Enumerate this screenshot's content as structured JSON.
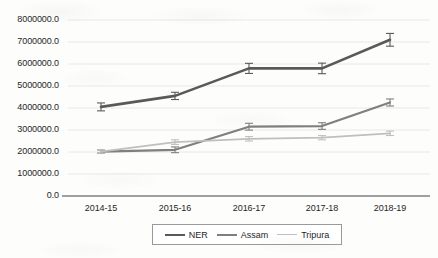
{
  "chart_data": {
    "type": "line",
    "title": "",
    "xlabel": "",
    "ylabel": "",
    "categories": [
      "2014-15",
      "2015-16",
      "2016-17",
      "2017-18",
      "2018-19"
    ],
    "ylim": [
      0,
      8000000
    ],
    "ytick_values": [
      0,
      1000000,
      2000000,
      3000000,
      4000000,
      5000000,
      6000000,
      7000000,
      8000000
    ],
    "ytick_labels": [
      "0.0",
      "1000000.0",
      "2000000.0",
      "3000000.0",
      "4000000.0",
      "5000000.0",
      "6000000.0",
      "7000000.0",
      "8000000.0"
    ],
    "grid": true,
    "grid_axis": "y",
    "legend_position": "bottom",
    "error_bars": true,
    "series": [
      {
        "name": "NER",
        "color": "#595959",
        "values": [
          4050000,
          4550000,
          5800000,
          5800000,
          7100000
        ],
        "errors": [
          180000,
          165000,
          230000,
          240000,
          290000
        ]
      },
      {
        "name": "Assam",
        "color": "#7f7f7f",
        "values": [
          2020000,
          2100000,
          3150000,
          3180000,
          4250000
        ],
        "errors": [
          70000,
          130000,
          155000,
          150000,
          160000
        ]
      },
      {
        "name": "Tripura",
        "color": "#bfbfbf",
        "values": [
          2020000,
          2450000,
          2600000,
          2650000,
          2850000
        ],
        "errors": [
          70000,
          105000,
          100000,
          95000,
          100000
        ]
      }
    ]
  },
  "legend": {
    "items": [
      {
        "label": "NER",
        "color": "#595959",
        "width": 2.6
      },
      {
        "label": "Assam",
        "color": "#7f7f7f",
        "width": 2.2
      },
      {
        "label": "Tripura",
        "color": "#bfbfbf",
        "width": 1.8
      }
    ]
  },
  "axes": {
    "axis_line_color": "#808080",
    "grid_color": "#e8e8e8"
  }
}
